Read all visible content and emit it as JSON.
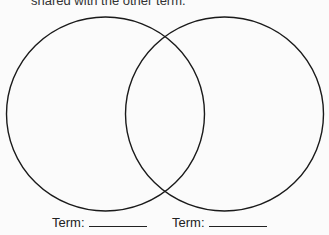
{
  "instruction_text": "shared with the other term.",
  "diagram": {
    "type": "venn",
    "circles": [
      {
        "name": "left",
        "cx": 105.5,
        "cy": 114,
        "r": 98
      },
      {
        "name": "right",
        "cx": 224.5,
        "cy": 114,
        "r": 98
      }
    ],
    "stroke_color": "#1a1a1a"
  },
  "labels": [
    {
      "text": "Term:",
      "blank": ""
    },
    {
      "text": "Term:",
      "blank": ""
    }
  ]
}
